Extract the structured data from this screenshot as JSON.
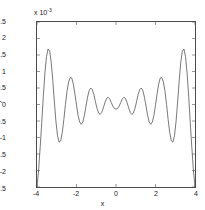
{
  "chart_data": {
    "type": "line",
    "title": "",
    "xlabel": "x",
    "ylabel": "y",
    "y_multiplier_label": "x 10",
    "y_multiplier_exponent": "-3",
    "y_scale": 0.001,
    "xlim": [
      -4,
      4
    ],
    "ylim": [
      -2.5,
      2.5
    ],
    "xticks": [
      -4,
      -2,
      0,
      2,
      4
    ],
    "xticklabels": [
      "-4",
      "-2",
      "0",
      "2",
      "4"
    ],
    "yticks": [
      -2.5,
      -2,
      -1.5,
      -1,
      -0.5,
      0,
      0.5,
      1,
      1.5,
      2,
      2.5
    ],
    "yticklabels": [
      "-2.5",
      "-2",
      "-1.5",
      "-1",
      "-0.5",
      "0",
      "0.5",
      "1",
      "1.5",
      "2",
      "2.5"
    ],
    "grid": false,
    "legend": null,
    "line_color": "#555555",
    "line_width": 0.8,
    "series": [
      {
        "name": "y",
        "x": [
          -4.0,
          -3.92,
          -3.84,
          -3.76,
          -3.68,
          -3.6,
          -3.52,
          -3.44,
          -3.36,
          -3.28,
          -3.2,
          -3.12,
          -3.04,
          -2.96,
          -2.88,
          -2.8,
          -2.72,
          -2.64,
          -2.56,
          -2.48,
          -2.4,
          -2.32,
          -2.24,
          -2.16,
          -2.08,
          -2.0,
          -1.92,
          -1.84,
          -1.76,
          -1.68,
          -1.6,
          -1.52,
          -1.44,
          -1.36,
          -1.28,
          -1.2,
          -1.12,
          -1.04,
          -0.96,
          -0.88,
          -0.8,
          -0.72,
          -0.64,
          -0.56,
          -0.48,
          -0.4,
          -0.32,
          -0.24,
          -0.16,
          -0.08,
          0.0,
          0.08,
          0.16,
          0.24,
          0.32,
          0.4,
          0.48,
          0.56,
          0.64,
          0.72,
          0.8,
          0.88,
          0.96,
          1.04,
          1.12,
          1.2,
          1.28,
          1.36,
          1.44,
          1.52,
          1.6,
          1.68,
          1.76,
          1.84,
          1.92,
          2.0,
          2.08,
          2.16,
          2.24,
          2.32,
          2.4,
          2.48,
          2.56,
          2.64,
          2.72,
          2.8,
          2.88,
          2.96,
          3.04,
          3.12,
          3.2,
          3.28,
          3.36,
          3.44,
          3.52,
          3.6,
          3.68,
          3.76,
          3.84,
          3.92,
          4.0
        ],
        "y": [
          -2.5,
          -2.0,
          -1.3,
          -0.55,
          0.25,
          0.95,
          1.45,
          1.68,
          1.62,
          1.28,
          0.72,
          0.08,
          -0.52,
          -0.95,
          -1.14,
          -1.1,
          -0.85,
          -0.45,
          0.0,
          0.4,
          0.68,
          0.82,
          0.8,
          0.62,
          0.32,
          -0.02,
          -0.33,
          -0.53,
          -0.6,
          -0.53,
          -0.33,
          -0.05,
          0.22,
          0.42,
          0.5,
          0.45,
          0.3,
          0.08,
          -0.12,
          -0.26,
          -0.3,
          -0.24,
          -0.1,
          0.06,
          0.18,
          0.22,
          0.17,
          0.06,
          -0.05,
          -0.12,
          -0.14,
          -0.12,
          -0.05,
          0.06,
          0.17,
          0.22,
          0.18,
          0.06,
          -0.1,
          -0.24,
          -0.3,
          -0.26,
          -0.12,
          0.08,
          0.3,
          0.45,
          0.5,
          0.42,
          0.22,
          -0.05,
          -0.33,
          -0.53,
          -0.6,
          -0.53,
          -0.33,
          -0.02,
          0.32,
          0.62,
          0.8,
          0.82,
          0.68,
          0.4,
          0.0,
          -0.45,
          -0.85,
          -1.1,
          -1.14,
          -0.95,
          -0.52,
          0.08,
          0.72,
          1.28,
          1.62,
          1.68,
          1.45,
          0.95,
          0.25,
          -0.55,
          -1.3,
          -2.0,
          -2.5
        ]
      }
    ]
  }
}
